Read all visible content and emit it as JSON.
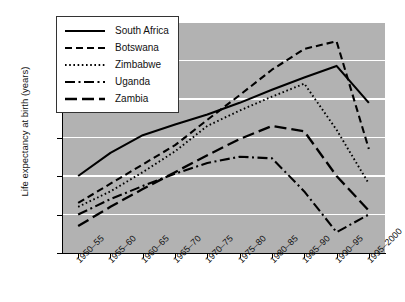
{
  "chart_data": {
    "type": "line",
    "title": "",
    "xlabel": "",
    "ylabel": "Life expectancy at birth (years)",
    "ylim": [
      35,
      65
    ],
    "yticks": [
      35,
      40,
      45,
      50,
      55,
      60,
      65
    ],
    "grid": true,
    "legend_position": "top-left",
    "categories": [
      "1950–55",
      "1955–60",
      "1960–65",
      "1965–70",
      "1970–75",
      "1975–80",
      "1980–85",
      "1985–90",
      "1990–95",
      "1995–2000"
    ],
    "series": [
      {
        "name": "South Africa",
        "style": "solid",
        "values": [
          45.0,
          48.0,
          50.3,
          51.7,
          53.0,
          54.5,
          56.2,
          57.8,
          59.3,
          54.5
        ]
      },
      {
        "name": "Botswana",
        "style": "dashed",
        "values": [
          41.5,
          44.0,
          46.5,
          49.0,
          52.3,
          55.5,
          58.8,
          61.5,
          62.5,
          48.5
        ]
      },
      {
        "name": "Zimbabwe",
        "style": "dotted",
        "values": [
          41.0,
          43.0,
          45.5,
          48.2,
          51.5,
          53.5,
          55.3,
          57.0,
          51.0,
          44.0
        ]
      },
      {
        "name": "Uganda",
        "style": "dashdot",
        "values": [
          40.0,
          42.0,
          43.7,
          45.3,
          46.7,
          47.5,
          47.3,
          43.0,
          37.7,
          40.0
        ]
      },
      {
        "name": "Zambia",
        "style": "longdash",
        "values": [
          38.5,
          41.0,
          43.3,
          45.5,
          47.7,
          49.8,
          51.5,
          50.8,
          45.0,
          40.5
        ]
      }
    ]
  },
  "legend": {
    "items": [
      {
        "label": "South Africa"
      },
      {
        "label": "Botswana"
      },
      {
        "label": "Zimbabwe"
      },
      {
        "label": "Uganda"
      },
      {
        "label": "Zambia"
      }
    ]
  }
}
